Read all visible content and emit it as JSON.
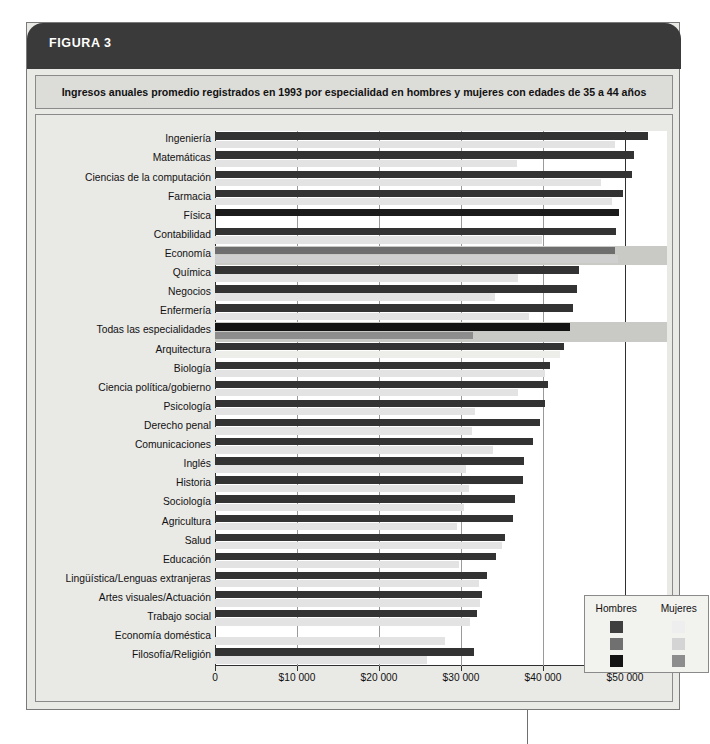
{
  "figure": {
    "banner_label": "FIGURA 3",
    "caption": "Ingresos anuales promedio registrados en 1993 por especialidad en hombres y mujeres con edades de 35 a 44 años",
    "banner_color": "#3a3a3a",
    "caption_bg": "#dcdcd8",
    "panel_bg": "#e9e9e6"
  },
  "legend": {
    "heading_men": "Hombres",
    "heading_women": "Mujeres",
    "rows": [
      {
        "men_color": "#3f3f3f",
        "women_color": "#eeeeee"
      },
      {
        "men_color": "#707070",
        "women_color": "#d4d4d4"
      },
      {
        "men_color": "#131313",
        "women_color": "#8d8d8d"
      }
    ]
  },
  "chart_data": {
    "type": "bar",
    "orientation": "horizontal",
    "title": "Ingresos anuales promedio registrados en 1993 por especialidad en hombres y mujeres con edades de 35 a 44 años",
    "xlabel": "",
    "ylabel": "",
    "xlim": [
      0,
      55000
    ],
    "grid": true,
    "legend_position": "bottom-right",
    "xticks": [
      0,
      10000,
      20000,
      30000,
      40000,
      50000
    ],
    "xtick_labels": [
      "0",
      "$10 000",
      "$20 000",
      "$30 000",
      "$40 000",
      "$50 000"
    ],
    "categories": [
      "Ingeniería",
      "Matemáticas",
      "Ciencias de la computación",
      "Farmacia",
      "Física",
      "Contabilidad",
      "Economía",
      "Química",
      "Negocios",
      "Enfermería",
      "Todas las especialidades",
      "Arquitectura",
      "Biología",
      "Ciencia política/gobierno",
      "Psicología",
      "Derecho penal",
      "Comunicaciones",
      "Inglés",
      "Historia",
      "Sociología",
      "Agricultura",
      "Salud",
      "Educación",
      "Lingüística/Lenguas extranjeras",
      "Artes visuales/Actuación",
      "Trabajo social",
      "Economía doméstica",
      "Filosofía/Religión"
    ],
    "series": [
      {
        "name": "Hombres",
        "color": "#333333",
        "values": [
          52800,
          51100,
          50900,
          49700,
          49300,
          48900,
          48800,
          44400,
          44100,
          43700,
          43300,
          42500,
          40800,
          40600,
          40200,
          39600,
          38800,
          37700,
          37600,
          36600,
          36300,
          35400,
          34300,
          33200,
          32500,
          31900,
          0,
          31600
        ]
      },
      {
        "name": "Mujeres",
        "color": "#e3e3e3",
        "values": [
          48800,
          36800,
          47100,
          48400,
          0,
          39900,
          49200,
          36900,
          34200,
          38300,
          31500,
          42100,
          40300,
          36900,
          31700,
          31300,
          33900,
          30600,
          31000,
          30400,
          29500,
          35000,
          29700,
          32200,
          32300,
          31100,
          28000,
          25800
        ]
      }
    ],
    "row_styles": [
      {
        "men": "#333333",
        "women": "#e3e3e3",
        "highlight": false
      },
      {
        "men": "#333333",
        "women": "#e3e3e3",
        "highlight": false
      },
      {
        "men": "#333333",
        "women": "#e3e3e3",
        "highlight": false
      },
      {
        "men": "#333333",
        "women": "#e3e3e3",
        "highlight": false
      },
      {
        "men": "#1b1b1b",
        "women": "#e3e3e3",
        "highlight": false
      },
      {
        "men": "#333333",
        "women": "#e3e3e3",
        "highlight": false
      },
      {
        "men": "#6e6e6e",
        "women": "#cfcfcf",
        "highlight": true
      },
      {
        "men": "#333333",
        "women": "#e3e3e3",
        "highlight": false
      },
      {
        "men": "#333333",
        "women": "#e3e3e3",
        "highlight": false
      },
      {
        "men": "#333333",
        "women": "#e3e3e3",
        "highlight": false
      },
      {
        "men": "#131313",
        "women": "#8d8d8d",
        "highlight": true
      },
      {
        "men": "#333333",
        "women": "#ededea",
        "highlight": false
      },
      {
        "men": "#333333",
        "women": "#e3e3e3",
        "highlight": false
      },
      {
        "men": "#333333",
        "women": "#e3e3e3",
        "highlight": false
      },
      {
        "men": "#333333",
        "women": "#e3e3e3",
        "highlight": false
      },
      {
        "men": "#333333",
        "women": "#e3e3e3",
        "highlight": false
      },
      {
        "men": "#333333",
        "women": "#e3e3e3",
        "highlight": false
      },
      {
        "men": "#333333",
        "women": "#e3e3e3",
        "highlight": false
      },
      {
        "men": "#333333",
        "women": "#e3e3e3",
        "highlight": false
      },
      {
        "men": "#333333",
        "women": "#e3e3e3",
        "highlight": false
      },
      {
        "men": "#333333",
        "women": "#e3e3e3",
        "highlight": false
      },
      {
        "men": "#333333",
        "women": "#e3e3e3",
        "highlight": false
      },
      {
        "men": "#333333",
        "women": "#e3e3e3",
        "highlight": false
      },
      {
        "men": "#333333",
        "women": "#e3e3e3",
        "highlight": false
      },
      {
        "men": "#333333",
        "women": "#e3e3e3",
        "highlight": false
      },
      {
        "men": "#333333",
        "women": "#e3e3e3",
        "highlight": false
      },
      {
        "men": "#333333",
        "women": "#e3e3e3",
        "highlight": false
      },
      {
        "men": "#333333",
        "women": "#e3e3e3",
        "highlight": false
      }
    ]
  }
}
